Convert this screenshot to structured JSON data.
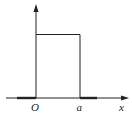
{
  "diagram": {
    "type": "rectangular-pulse",
    "labels": {
      "origin": "O",
      "a": "a",
      "x_axis": "x"
    },
    "colors": {
      "stroke": "#222222",
      "background": "#ffffff"
    }
  }
}
